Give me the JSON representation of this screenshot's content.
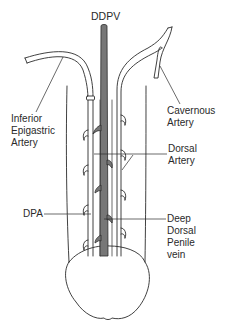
{
  "diagram": {
    "type": "anatomical-illustration",
    "colors": {
      "line": "#2b2b2b",
      "vein_fill": "#777777",
      "background": "#ffffff",
      "text": "#2a2a2a"
    },
    "labels": {
      "ddpv": {
        "text": "DDPV"
      },
      "inferior_epigastric": {
        "lines": [
          "Inferior",
          "Epigastric",
          "Artery"
        ]
      },
      "cavernous": {
        "lines": [
          "Cavernous",
          "Artery"
        ]
      },
      "dorsal": {
        "lines": [
          "Dorsal",
          "Artery"
        ]
      },
      "dpa": {
        "text": "DPA"
      },
      "deep_dorsal_penile_vein": {
        "lines": [
          "Deep",
          "Dorsal",
          "Penile",
          "vein"
        ]
      }
    }
  }
}
